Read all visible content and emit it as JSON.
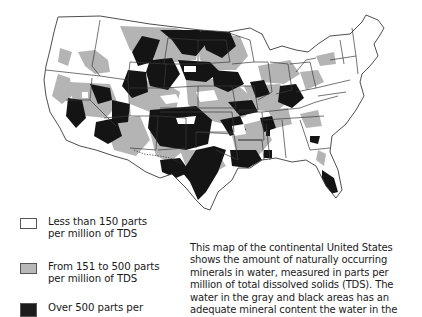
{
  "map": {
    "subject": "Continental United States — naturally occurring minerals in water (TDS)",
    "colors": {
      "low": "#ffffff",
      "medium": "#b4b4b4",
      "high": "#141414",
      "border": "#3a3a3a"
    }
  },
  "legend": {
    "items": [
      {
        "label": "Less than 150 parts\nper million of TDS",
        "color": "#ffffff"
      },
      {
        "label": "From 151 to 500 parts\nper million of TDS",
        "color": "#b8b8b8"
      },
      {
        "label": "Over 500 parts per",
        "color": "#1c1c1c"
      }
    ]
  },
  "description": {
    "lines": [
      "This map of the continental United States",
      "shows the amount of naturally occurring",
      "minerals in water, measured in parts per",
      "million of total dissolved solids (TDS). The",
      "water in the gray and black areas has an",
      "adequate mineral content the water in the"
    ]
  }
}
